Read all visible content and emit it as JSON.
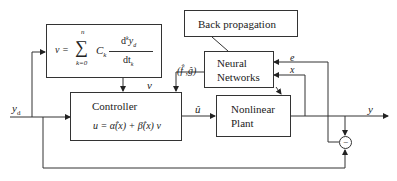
{
  "diagram": {
    "blocks": {
      "reference_model": {
        "lhs": "v =",
        "sum_symbol": "∑",
        "sum_upper": "n",
        "sum_lower": "k=0",
        "coef": "C",
        "coef_sub": "k",
        "numerator": "d",
        "numerator_sup": "k",
        "numerator_var": "y",
        "numerator_var_sub": "d",
        "denominator": "dt",
        "denominator_sub": "k"
      },
      "back_propagation": {
        "label": "Back propagation"
      },
      "neural_networks": {
        "line1": "Neural",
        "line2": "Networks"
      },
      "controller": {
        "label": "Controller",
        "law": "u = α̂(x) + β̂(x) v"
      },
      "plant": {
        "line1": "Nonlinear",
        "line2": "Plant"
      },
      "summing_junction": {
        "sign": "−"
      }
    },
    "signals": {
      "yd": "y",
      "yd_sub": "d",
      "v": "v",
      "fg": "(f̂ ,ĝ)",
      "u_hat": "û",
      "y": "y",
      "e": "e",
      "x": "x"
    },
    "colors": {
      "line": "#333333",
      "background": "#ffffff"
    }
  }
}
